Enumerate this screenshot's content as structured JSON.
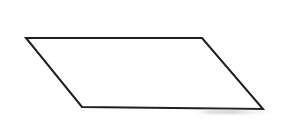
{
  "figure": {
    "background_color": "#ffffff",
    "canvas": {
      "width": 286,
      "height": 134
    },
    "shape": {
      "name": "parallelogram",
      "fill": "none",
      "fill_color": "#ffffff",
      "stroke_color": "#1f1f1f",
      "stroke_width": 2,
      "vertices": [
        {
          "label": "top-left",
          "x": 26,
          "y": 38
        },
        {
          "label": "top-right",
          "x": 202,
          "y": 38
        },
        {
          "label": "bottom-right",
          "x": 263,
          "y": 109
        },
        {
          "label": "bottom-left",
          "x": 82,
          "y": 107
        }
      ],
      "edges": [
        {
          "name": "top-edge",
          "from": "top-left",
          "to": "top-right"
        },
        {
          "name": "right-edge",
          "from": "top-right",
          "to": "bottom-right"
        },
        {
          "name": "bottom-edge",
          "from": "bottom-right",
          "to": "bottom-left"
        },
        {
          "name": "left-edge",
          "from": "bottom-left",
          "to": "top-left"
        }
      ]
    },
    "artifacts": {
      "scan_smudge_color": "#c6c6c6"
    }
  }
}
